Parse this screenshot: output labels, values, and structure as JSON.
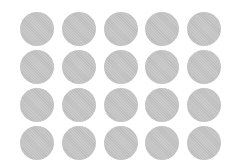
{
  "canvas": {
    "width": 241,
    "height": 162,
    "background": "#ffffff"
  },
  "grid": {
    "rows": 4,
    "columns": 5,
    "origin_x": 20,
    "origin_y": 12,
    "col_pitch": 41.75,
    "row_pitch": 38,
    "diameter": 34,
    "dot_color": "#c4c4c4",
    "shape": "circle-icon"
  }
}
